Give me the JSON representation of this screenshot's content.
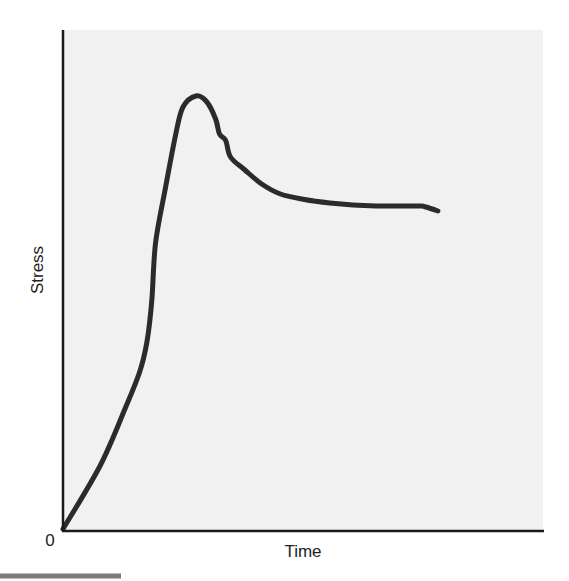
{
  "chart_data": {
    "type": "line",
    "title": "",
    "xlabel": "Time",
    "ylabel": "Stress",
    "origin_label": "0",
    "x_ticks": [],
    "y_ticks": [],
    "grid": false,
    "legend": null,
    "xlim": [
      0,
      100
    ],
    "ylim": [
      0,
      100
    ],
    "series": [
      {
        "name": "Stress vs Time",
        "color": "#2b2b2b",
        "x": [
          0,
          7.7,
          12.9,
          16.0,
          17.5,
          18.5,
          19.3,
          21.4,
          23.5,
          25.0,
          27.7,
          29.9,
          31.8,
          32.6,
          33.9,
          34.9,
          37.9,
          41.4,
          45.3,
          50.3,
          55.6,
          60.4,
          65.2,
          70.4,
          74.6,
          75.6,
          78.1
        ],
        "y": [
          0,
          12.6,
          24.0,
          31.5,
          37.5,
          45.7,
          57.3,
          68.5,
          79.0,
          84.4,
          86.6,
          85.5,
          82.0,
          79.0,
          77.7,
          74.4,
          71.8,
          69.0,
          67.0,
          65.9,
          65.2,
          64.8,
          64.6,
          64.6,
          64.6,
          64.4,
          63.6
        ]
      }
    ],
    "annotations": []
  }
}
